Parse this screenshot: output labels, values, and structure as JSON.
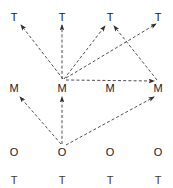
{
  "figure": {
    "width": 173,
    "height": 188,
    "background_color": "#ffffff",
    "line_color": "#3a3a3a",
    "text_color": "#1a1a1a",
    "line_style": "dashed",
    "columns": 4,
    "rows": 4
  },
  "grid": {
    "column_x": [
      14,
      70,
      120,
      162
    ],
    "row_y": [
      17,
      88,
      152,
      180
    ],
    "row_labels": [
      "T",
      "M",
      "O",
      "T"
    ]
  },
  "nodes": [
    {
      "id": "T1",
      "label": "T",
      "col": 0,
      "row": 0,
      "x": 14,
      "y": 17
    },
    {
      "id": "T2",
      "label": "T",
      "col": 1,
      "row": 0,
      "x": 62,
      "y": 17
    },
    {
      "id": "T3",
      "label": "T",
      "col": 2,
      "row": 0,
      "x": 110,
      "y": 17
    },
    {
      "id": "T4",
      "label": "T",
      "col": 3,
      "row": 0,
      "x": 158,
      "y": 17
    },
    {
      "id": "M1",
      "label": "M",
      "col": 0,
      "row": 1,
      "x": 14,
      "y": 88
    },
    {
      "id": "M2",
      "label": "M",
      "col": 1,
      "row": 1,
      "x": 62,
      "y": 88
    },
    {
      "id": "M3",
      "label": "M",
      "col": 2,
      "row": 1,
      "x": 110,
      "y": 88
    },
    {
      "id": "M4",
      "label": "M",
      "col": 3,
      "row": 1,
      "x": 158,
      "y": 88
    },
    {
      "id": "O1",
      "label": "O",
      "col": 0,
      "row": 2,
      "x": 14,
      "y": 152
    },
    {
      "id": "O2",
      "label": "O",
      "col": 1,
      "row": 2,
      "x": 62,
      "y": 152
    },
    {
      "id": "O3",
      "label": "O",
      "col": 2,
      "row": 2,
      "x": 110,
      "y": 152
    },
    {
      "id": "O4",
      "label": "O",
      "col": 3,
      "row": 2,
      "x": 158,
      "y": 152
    },
    {
      "id": "T5",
      "label": "T",
      "col": 0,
      "row": 3,
      "x": 14,
      "y": 180
    },
    {
      "id": "T6",
      "label": "T",
      "col": 1,
      "row": 3,
      "x": 62,
      "y": 180
    },
    {
      "id": "T7",
      "label": "T",
      "col": 2,
      "row": 3,
      "x": 110,
      "y": 180
    },
    {
      "id": "T8",
      "label": "T",
      "col": 3,
      "row": 3,
      "x": 158,
      "y": 180
    }
  ],
  "edges": [
    {
      "id": "e1",
      "from": "M2",
      "to": "T1",
      "x1": 63,
      "y1": 79,
      "x2": 21,
      "y2": 25,
      "style": "dashed",
      "arrow": "end"
    },
    {
      "id": "e2",
      "from": "M2",
      "to": "T2",
      "x1": 62,
      "y1": 79,
      "x2": 62,
      "y2": 25,
      "style": "dashed",
      "arrow": "end"
    },
    {
      "id": "e3",
      "from": "M2",
      "to": "T3",
      "x1": 64,
      "y1": 79,
      "x2": 105,
      "y2": 26,
      "style": "dashed",
      "arrow": "end"
    },
    {
      "id": "e4",
      "from": "M2",
      "to": "M4",
      "x1": 66,
      "y1": 80,
      "x2": 154,
      "y2": 81,
      "style": "dashed",
      "arrow": "end"
    },
    {
      "id": "e5",
      "from": "M4",
      "to": "T3",
      "x1": 157,
      "y1": 80,
      "x2": 114,
      "y2": 26,
      "style": "dashed",
      "arrow": "end"
    },
    {
      "id": "e6",
      "from": "M2",
      "to": "T4",
      "x1": 66,
      "y1": 78,
      "x2": 156,
      "y2": 24,
      "style": "dashed",
      "arrow": "end"
    },
    {
      "id": "e7",
      "from": "O2",
      "to": "M1",
      "x1": 61,
      "y1": 144,
      "x2": 20,
      "y2": 97,
      "style": "dashed",
      "arrow": "end"
    },
    {
      "id": "e8",
      "from": "O2",
      "to": "M2",
      "x1": 62,
      "y1": 144,
      "x2": 62,
      "y2": 97,
      "style": "dashed",
      "arrow": "end"
    },
    {
      "id": "e9",
      "from": "O2",
      "to": "M4",
      "x1": 66,
      "y1": 145,
      "x2": 154,
      "y2": 97,
      "style": "dashed",
      "arrow": "end"
    }
  ]
}
